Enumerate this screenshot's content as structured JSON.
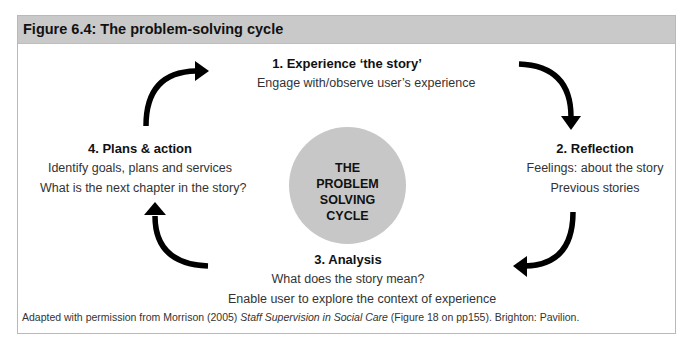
{
  "figure": {
    "title": "Figure 6.4: The problem-solving cycle",
    "center_label": [
      "THE",
      "PROBLEM",
      "SOLVING",
      "CYCLE"
    ],
    "steps": [
      {
        "heading": "1. Experience ‘the story’",
        "lines": [
          "Engage with/observe user’s experience"
        ]
      },
      {
        "heading": "2. Reflection",
        "lines": [
          "Feelings: about the story",
          "Previous stories"
        ]
      },
      {
        "heading": "3. Analysis",
        "lines": [
          "What does the story mean?",
          "Enable user to explore the context of experience"
        ]
      },
      {
        "heading": "4. Plans & action",
        "lines": [
          "Identify goals, plans and services",
          "What is the next chapter in the story?"
        ]
      }
    ],
    "arrows": [
      "arrow-to-step-1",
      "arrow-to-step-2",
      "arrow-to-step-3",
      "arrow-to-step-4"
    ],
    "colors": {
      "header_bg": "#c9c9c9",
      "circle_fill": "#c7c7c7",
      "arrow": "#000000",
      "border": "#b9b9b9"
    }
  },
  "caption": {
    "prefix": "Adapted with permission from Morrison (2005) ",
    "italic": "Staff Supervision in Social Care",
    "suffix": " (Figure 18 on pp155). Brighton: Pavilion."
  }
}
